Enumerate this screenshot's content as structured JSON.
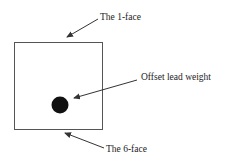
{
  "diagram": {
    "labels": {
      "top_face": "The 1-face",
      "weight": "Offset lead weight",
      "bottom_face": "The 6-face"
    },
    "colors": {
      "line": "#555555",
      "weight_fill": "#111111",
      "text": "#222222"
    }
  }
}
